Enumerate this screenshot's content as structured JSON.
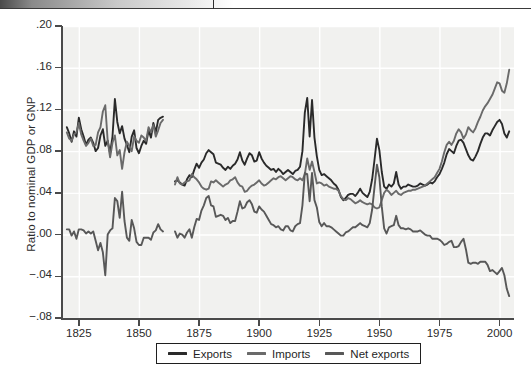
{
  "figure": {
    "background": "#ffffff",
    "plot_background": "#f1f1ef",
    "gridline_color": "#ffffff",
    "axis_color": "#4a4a4a"
  },
  "chart_data": {
    "type": "line",
    "title": "",
    "xlabel": "",
    "ylabel": "Ratio to nominal GDP or GNP",
    "xlim": [
      1818,
      2006
    ],
    "ylim": [
      -0.08,
      0.2
    ],
    "grid": true,
    "legend_position": "below-axes",
    "xticks": [
      1825,
      1850,
      1875,
      1900,
      1925,
      1950,
      1975,
      2000
    ],
    "xtick_labels": [
      "1825",
      "1850",
      "1875",
      "1900",
      "1925",
      "1950",
      "1975",
      "2000"
    ],
    "yticks": [
      0.2,
      0.16,
      0.12,
      0.08,
      0.04,
      0.0,
      -0.04,
      -0.08
    ],
    "ytick_labels": [
      ".20",
      ".16",
      ".12",
      ".08",
      ".04",
      ".00",
      "−.04",
      "−.08"
    ],
    "colors": {
      "exports": "#2a2a2a",
      "imports": "#6a6a6a",
      "net_exports": "#585858"
    },
    "series": [
      {
        "name": "Exports",
        "color": "#2a2a2a",
        "segments": [
          {
            "x_start": 1820,
            "x_end": 1860,
            "values": [
              0.103,
              0.097,
              0.089,
              0.099,
              0.094,
              0.112,
              0.101,
              0.094,
              0.086,
              0.091,
              0.093,
              0.088,
              0.08,
              0.083,
              0.095,
              0.101,
              0.085,
              0.09,
              0.078,
              0.094,
              0.13,
              0.108,
              0.097,
              0.104,
              0.092,
              0.086,
              0.079,
              0.094,
              0.1,
              0.083,
              0.078,
              0.085,
              0.09,
              0.087,
              0.1,
              0.093,
              0.107,
              0.098,
              0.11,
              0.112,
              0.113
            ]
          },
          {
            "x_start": 1865,
            "x_end": 2004,
            "values": [
              0.051,
              0.052,
              0.05,
              0.048,
              0.047,
              0.053,
              0.057,
              0.055,
              0.062,
              0.068,
              0.064,
              0.069,
              0.072,
              0.078,
              0.081,
              0.079,
              0.077,
              0.069,
              0.068,
              0.067,
              0.064,
              0.062,
              0.065,
              0.063,
              0.066,
              0.068,
              0.072,
              0.079,
              0.071,
              0.067,
              0.073,
              0.078,
              0.076,
              0.07,
              0.071,
              0.079,
              0.073,
              0.069,
              0.066,
              0.064,
              0.062,
              0.063,
              0.06,
              0.063,
              0.061,
              0.058,
              0.06,
              0.062,
              0.06,
              0.058,
              0.061,
              0.062,
              0.065,
              0.08,
              0.117,
              0.131,
              0.094,
              0.129,
              0.093,
              0.075,
              0.062,
              0.057,
              0.058,
              0.056,
              0.054,
              0.052,
              0.049,
              0.047,
              0.043,
              0.036,
              0.033,
              0.035,
              0.038,
              0.039,
              0.039,
              0.037,
              0.04,
              0.044,
              0.04,
              0.038,
              0.036,
              0.041,
              0.053,
              0.072,
              0.092,
              0.081,
              0.06,
              0.046,
              0.044,
              0.048,
              0.046,
              0.049,
              0.06,
              0.048,
              0.044,
              0.046,
              0.046,
              0.048,
              0.047,
              0.046,
              0.046,
              0.047,
              0.049,
              0.048,
              0.047,
              0.048,
              0.05,
              0.049,
              0.051,
              0.055,
              0.058,
              0.063,
              0.069,
              0.077,
              0.082,
              0.08,
              0.078,
              0.085,
              0.09,
              0.091,
              0.088,
              0.082,
              0.076,
              0.072,
              0.071,
              0.075,
              0.08,
              0.087,
              0.093,
              0.097,
              0.097,
              0.095,
              0.1,
              0.104,
              0.108,
              0.11,
              0.106,
              0.097,
              0.093,
              0.099
            ]
          }
        ]
      },
      {
        "name": "Imports",
        "color": "#6a6a6a",
        "segments": [
          {
            "x_start": 1820,
            "x_end": 1860,
            "values": [
              0.098,
              0.092,
              0.09,
              0.096,
              0.098,
              0.107,
              0.096,
              0.09,
              0.085,
              0.088,
              0.092,
              0.085,
              0.086,
              0.098,
              0.103,
              0.118,
              0.124,
              0.09,
              0.074,
              0.088,
              0.095,
              0.076,
              0.081,
              0.063,
              0.079,
              0.089,
              0.085,
              0.08,
              0.094,
              0.09,
              0.088,
              0.095,
              0.093,
              0.09,
              0.103,
              0.098,
              0.105,
              0.094,
              0.1,
              0.107,
              0.11
            ]
          },
          {
            "x_start": 1865,
            "x_end": 2004,
            "values": [
              0.048,
              0.055,
              0.049,
              0.048,
              0.05,
              0.051,
              0.052,
              0.058,
              0.055,
              0.053,
              0.05,
              0.046,
              0.044,
              0.043,
              0.044,
              0.051,
              0.05,
              0.052,
              0.05,
              0.048,
              0.046,
              0.048,
              0.049,
              0.052,
              0.053,
              0.055,
              0.05,
              0.047,
              0.046,
              0.041,
              0.042,
              0.045,
              0.047,
              0.048,
              0.05,
              0.052,
              0.049,
              0.047,
              0.048,
              0.05,
              0.052,
              0.054,
              0.053,
              0.055,
              0.056,
              0.054,
              0.052,
              0.054,
              0.056,
              0.055,
              0.053,
              0.052,
              0.054,
              0.052,
              0.058,
              0.073,
              0.062,
              0.07,
              0.06,
              0.049,
              0.05,
              0.049,
              0.047,
              0.048,
              0.046,
              0.045,
              0.044,
              0.044,
              0.042,
              0.037,
              0.034,
              0.033,
              0.035,
              0.034,
              0.032,
              0.03,
              0.031,
              0.033,
              0.031,
              0.03,
              0.029,
              0.03,
              0.029,
              0.026,
              0.025,
              0.026,
              0.033,
              0.04,
              0.043,
              0.041,
              0.038,
              0.04,
              0.042,
              0.039,
              0.038,
              0.04,
              0.041,
              0.042,
              0.042,
              0.043,
              0.043,
              0.044,
              0.045,
              0.046,
              0.047,
              0.049,
              0.051,
              0.053,
              0.055,
              0.059,
              0.063,
              0.07,
              0.079,
              0.086,
              0.089,
              0.086,
              0.09,
              0.097,
              0.101,
              0.098,
              0.092,
              0.096,
              0.103,
              0.1,
              0.098,
              0.102,
              0.108,
              0.113,
              0.119,
              0.123,
              0.126,
              0.13,
              0.134,
              0.14,
              0.146,
              0.145,
              0.138,
              0.136,
              0.145,
              0.158
            ]
          }
        ]
      },
      {
        "name": "Net exports",
        "color": "#585858",
        "segments": [
          {
            "x_start": 1820,
            "x_end": 1860,
            "values": [
              0.005,
              0.005,
              -0.001,
              0.003,
              -0.004,
              0.005,
              0.005,
              0.004,
              0.001,
              0.003,
              0.001,
              0.003,
              -0.006,
              -0.015,
              -0.008,
              -0.017,
              -0.039,
              0.0,
              0.004,
              0.006,
              0.035,
              0.032,
              0.016,
              0.041,
              0.013,
              -0.003,
              -0.006,
              0.014,
              0.006,
              -0.007,
              -0.01,
              -0.01,
              -0.003,
              -0.003,
              -0.003,
              -0.005,
              0.002,
              0.004,
              0.01,
              0.005,
              0.003
            ]
          },
          {
            "x_start": 1865,
            "x_end": 2004,
            "values": [
              0.003,
              -0.003,
              0.001,
              0.0,
              -0.003,
              0.002,
              0.005,
              -0.003,
              0.007,
              0.015,
              0.014,
              0.023,
              0.028,
              0.035,
              0.037,
              0.028,
              0.027,
              0.017,
              0.018,
              0.019,
              0.018,
              0.014,
              0.016,
              0.011,
              0.013,
              0.013,
              0.022,
              0.032,
              0.025,
              0.026,
              0.031,
              0.033,
              0.029,
              0.022,
              0.021,
              0.027,
              0.024,
              0.022,
              0.018,
              0.014,
              0.01,
              0.009,
              0.007,
              0.008,
              0.005,
              0.004,
              0.008,
              0.008,
              0.004,
              0.003,
              0.008,
              0.01,
              0.011,
              0.028,
              0.059,
              0.058,
              0.032,
              0.059,
              0.033,
              0.026,
              0.012,
              0.008,
              0.011,
              0.008,
              0.008,
              0.007,
              0.005,
              0.003,
              0.001,
              -0.001,
              -0.001,
              0.002,
              0.003,
              0.005,
              0.007,
              0.007,
              0.009,
              0.011,
              0.009,
              0.008,
              0.007,
              0.011,
              0.024,
              0.046,
              0.067,
              0.055,
              0.027,
              0.006,
              0.001,
              0.007,
              0.008,
              0.009,
              0.018,
              0.009,
              0.006,
              0.006,
              0.005,
              0.006,
              0.005,
              0.003,
              0.003,
              0.003,
              0.004,
              0.002,
              0.0,
              -0.001,
              -0.001,
              -0.004,
              -0.004,
              -0.004,
              -0.005,
              -0.007,
              -0.01,
              -0.009,
              -0.007,
              -0.006,
              -0.012,
              -0.012,
              -0.011,
              -0.007,
              -0.004,
              -0.014,
              -0.027,
              -0.028,
              -0.027,
              -0.027,
              -0.028,
              -0.026,
              -0.026,
              -0.026,
              -0.029,
              -0.035,
              -0.034,
              -0.036,
              -0.038,
              -0.035,
              -0.032,
              -0.039,
              -0.052,
              -0.059
            ]
          }
        ]
      }
    ]
  },
  "legend": {
    "entries": [
      {
        "label": "Exports",
        "color": "#2a2a2a"
      },
      {
        "label": "Imports",
        "color": "#6a6a6a"
      },
      {
        "label": "Net exports",
        "color": "#585858"
      }
    ]
  }
}
